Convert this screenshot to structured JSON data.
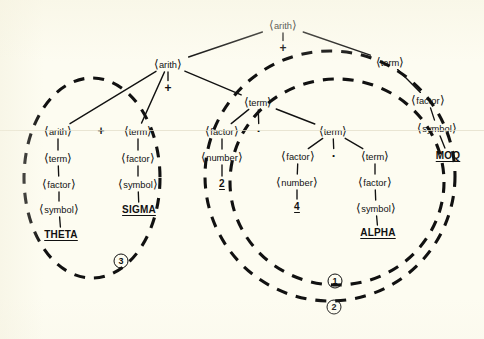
{
  "figure": {
    "type": "parse-tree-diagram",
    "background_color": "#fdfcf1",
    "ink_color": "#111111",
    "width": 484,
    "height": 339
  },
  "nodes": [
    {
      "id": "n_root",
      "label": "⟨arith⟩",
      "kind": "nonterminal",
      "x": 283,
      "y": 25
    },
    {
      "id": "n_root_op",
      "label": "+",
      "kind": "operator",
      "x": 283,
      "y": 48
    },
    {
      "id": "n_a2",
      "label": "⟨arith⟩",
      "kind": "nonterminal",
      "x": 168,
      "y": 64
    },
    {
      "id": "n_a2_op",
      "label": "+",
      "kind": "operator",
      "x": 168,
      "y": 88
    },
    {
      "id": "n_t_right",
      "label": "⟨term⟩",
      "kind": "nonterminal",
      "x": 390,
      "y": 62
    },
    {
      "id": "n_f_right",
      "label": "⟨factor⟩",
      "kind": "nonterminal",
      "x": 428,
      "y": 100
    },
    {
      "id": "n_s_right",
      "label": "⟨symbol⟩",
      "kind": "nonterminal",
      "x": 437,
      "y": 128
    },
    {
      "id": "n_moq",
      "label": "MOQ",
      "kind": "terminal",
      "x": 448,
      "y": 156
    },
    {
      "id": "n_a3",
      "label": "⟨arith⟩",
      "kind": "nonterminal",
      "x": 58,
      "y": 131
    },
    {
      "id": "n_a3_op",
      "label": "+",
      "kind": "operator",
      "x": 101,
      "y": 131
    },
    {
      "id": "n_t_sigma",
      "label": "⟨term⟩",
      "kind": "nonterminal",
      "x": 138,
      "y": 131
    },
    {
      "id": "n_t_theta",
      "label": "⟨term⟩",
      "kind": "nonterminal",
      "x": 58,
      "y": 158
    },
    {
      "id": "n_f_theta",
      "label": "⟨factor⟩",
      "kind": "nonterminal",
      "x": 59,
      "y": 184
    },
    {
      "id": "n_s_theta",
      "label": "⟨symbol⟩",
      "kind": "nonterminal",
      "x": 59,
      "y": 209
    },
    {
      "id": "n_theta",
      "label": "THETA",
      "kind": "terminal",
      "x": 61,
      "y": 235
    },
    {
      "id": "n_f_sigma",
      "label": "⟨factor⟩",
      "kind": "nonterminal",
      "x": 138,
      "y": 158
    },
    {
      "id": "n_s_sigma",
      "label": "⟨symbol⟩",
      "kind": "nonterminal",
      "x": 138,
      "y": 184
    },
    {
      "id": "n_sigma",
      "label": "SIGMA",
      "kind": "terminal",
      "x": 139,
      "y": 210
    },
    {
      "id": "n_tm1",
      "label": "⟨term⟩",
      "kind": "nonterminal",
      "x": 258,
      "y": 102
    },
    {
      "id": "n_tm1_op",
      "label": "·",
      "kind": "dot",
      "x": 259,
      "y": 131
    },
    {
      "id": "n_f_two",
      "label": "⟨factor⟩",
      "kind": "nonterminal",
      "x": 222,
      "y": 131
    },
    {
      "id": "n_num_two",
      "label": "⟨number⟩",
      "kind": "nonterminal",
      "x": 222,
      "y": 157
    },
    {
      "id": "n_two",
      "label": "2",
      "kind": "terminal",
      "x": 222,
      "y": 184
    },
    {
      "id": "n_tm2",
      "label": "⟨term⟩",
      "kind": "nonterminal",
      "x": 333,
      "y": 131
    },
    {
      "id": "n_tm2_op",
      "label": "·",
      "kind": "dot",
      "x": 334,
      "y": 156
    },
    {
      "id": "n_f_four",
      "label": "⟨factor⟩",
      "kind": "nonterminal",
      "x": 298,
      "y": 156
    },
    {
      "id": "n_num_four",
      "label": "⟨number⟩",
      "kind": "nonterminal",
      "x": 297,
      "y": 182
    },
    {
      "id": "n_four",
      "label": "4",
      "kind": "terminal",
      "x": 297,
      "y": 207
    },
    {
      "id": "n_tm3",
      "label": "⟨term⟩",
      "kind": "nonterminal",
      "x": 375,
      "y": 156
    },
    {
      "id": "n_f_alpha",
      "label": "⟨factor⟩",
      "kind": "nonterminal",
      "x": 375,
      "y": 182
    },
    {
      "id": "n_s_alpha",
      "label": "⟨symbol⟩",
      "kind": "nonterminal",
      "x": 376,
      "y": 208
    },
    {
      "id": "n_alpha",
      "label": "ALPHA",
      "kind": "terminal",
      "x": 378,
      "y": 233
    }
  ],
  "edges": [
    {
      "from": "n_root",
      "to": "n_a2"
    },
    {
      "from": "n_root",
      "to": "n_root_op"
    },
    {
      "from": "n_root",
      "to": "n_t_right"
    },
    {
      "from": "n_a2",
      "to": "n_a3"
    },
    {
      "from": "n_a2",
      "to": "n_a2_op"
    },
    {
      "from": "n_a2",
      "to": "n_t_sigma"
    },
    {
      "from": "n_a3",
      "to": "n_t_theta"
    },
    {
      "from": "n_t_theta",
      "to": "n_f_theta"
    },
    {
      "from": "n_f_theta",
      "to": "n_s_theta"
    },
    {
      "from": "n_s_theta",
      "to": "n_theta"
    },
    {
      "from": "n_t_sigma",
      "to": "n_f_sigma"
    },
    {
      "from": "n_f_sigma",
      "to": "n_s_sigma"
    },
    {
      "from": "n_s_sigma",
      "to": "n_sigma"
    },
    {
      "from": "n_t_right",
      "to": "n_f_right"
    },
    {
      "from": "n_f_right",
      "to": "n_s_right"
    },
    {
      "from": "n_s_right",
      "to": "n_moq"
    },
    {
      "from": "n_a2",
      "to": "n_tm1"
    },
    {
      "from": "n_tm1",
      "to": "n_f_two"
    },
    {
      "from": "n_tm1",
      "to": "n_tm1_op"
    },
    {
      "from": "n_tm1",
      "to": "n_tm2"
    },
    {
      "from": "n_f_two",
      "to": "n_num_two"
    },
    {
      "from": "n_num_two",
      "to": "n_two"
    },
    {
      "from": "n_tm2",
      "to": "n_f_four"
    },
    {
      "from": "n_tm2",
      "to": "n_tm2_op"
    },
    {
      "from": "n_tm2",
      "to": "n_tm3"
    },
    {
      "from": "n_f_four",
      "to": "n_num_four"
    },
    {
      "from": "n_num_four",
      "to": "n_four"
    },
    {
      "from": "n_tm3",
      "to": "n_f_alpha"
    },
    {
      "from": "n_f_alpha",
      "to": "n_s_alpha"
    },
    {
      "from": "n_s_alpha",
      "to": "n_alpha"
    }
  ],
  "groups": [
    {
      "id": "g3",
      "number": "3",
      "label_x": 121,
      "label_y": 261,
      "cx": 92,
      "cy": 178,
      "rx": 68,
      "ry": 100,
      "rotate": 0
    },
    {
      "id": "g1",
      "number": "1",
      "label_x": 335,
      "label_y": 281,
      "cx": 337,
      "cy": 182,
      "rx": 107,
      "ry": 103,
      "rotate": 0
    },
    {
      "id": "g2",
      "number": "2",
      "label_x": 334,
      "label_y": 307,
      "cx": 330,
      "cy": 176,
      "rx": 125,
      "ry": 125,
      "rotate": 0
    }
  ],
  "group_numbers": [
    "1",
    "2",
    "3"
  ]
}
